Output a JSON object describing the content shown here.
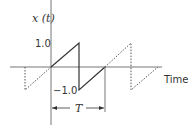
{
  "diagram": {
    "y_axis_label": "x (t)",
    "x_axis_label": "Time",
    "tick_labels": {
      "positive": "1.0",
      "negative": "−1.0"
    },
    "period_label": "T",
    "colors": {
      "line": "#333333",
      "dotted": "#555555",
      "axis": "#777777"
    }
  }
}
